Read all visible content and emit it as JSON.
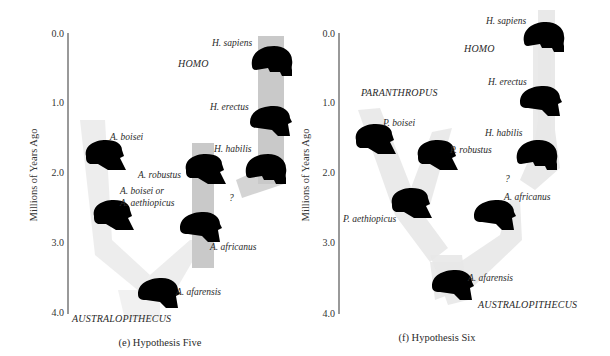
{
  "panels": [
    {
      "id": "e",
      "caption": "(e)  Hypothesis Five",
      "axis": {
        "title": "Millions of Years Ago",
        "ticks": [
          "0.0",
          "1.0",
          "2.0",
          "3.0",
          "4.0"
        ]
      },
      "genus_labels": {
        "homo": "HOMO",
        "australopithecus": "AUSTRALOPITHECUS"
      },
      "species": [
        {
          "name": "H. sapiens",
          "approx_mya": 0.3
        },
        {
          "name": "H. erectus",
          "approx_mya": 1.2
        },
        {
          "name": "H. habilis",
          "approx_mya": 2.0
        },
        {
          "name": "A. robustus",
          "approx_mya": 1.9
        },
        {
          "name": "A. boisei",
          "approx_mya": 1.7
        },
        {
          "name": "A. boisei or",
          "approx_mya": 2.4
        },
        {
          "name": "A. aethiopicus",
          "approx_mya": 2.6
        },
        {
          "name": "A. africanus",
          "approx_mya": 2.7
        },
        {
          "name": "A. afarensis",
          "approx_mya": 3.6
        }
      ],
      "uncertain_marker": "?"
    },
    {
      "id": "f",
      "caption": "(f)  Hypothesis Six",
      "axis": {
        "title": "Millions of Years Ago",
        "ticks": [
          "0.0",
          "1.0",
          "2.0",
          "3.0",
          "4.0"
        ]
      },
      "genus_labels": {
        "homo": "HOMO",
        "paranthropus": "PARANTHROPUS",
        "australopithecus": "AUSTRALOPITHECUS"
      },
      "species": [
        {
          "name": "H. sapiens",
          "approx_mya": 0.2
        },
        {
          "name": "H. erectus",
          "approx_mya": 1.0
        },
        {
          "name": "H. habilis",
          "approx_mya": 1.8
        },
        {
          "name": "P. boisei",
          "approx_mya": 1.6
        },
        {
          "name": "P. robustus",
          "approx_mya": 1.8
        },
        {
          "name": "P. aethiopicus",
          "approx_mya": 2.6
        },
        {
          "name": "A. africanus",
          "approx_mya": 2.6
        },
        {
          "name": "A. afarensis",
          "approx_mya": 3.5
        }
      ],
      "uncertain_marker": "?"
    }
  ]
}
